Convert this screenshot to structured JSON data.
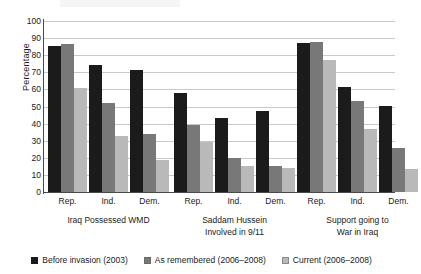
{
  "chart_data": {
    "type": "bar",
    "title": "",
    "xlabel": "",
    "ylabel": "Percentage",
    "ylim": [
      0,
      100
    ],
    "ytick_values": [
      0,
      10,
      20,
      30,
      40,
      50,
      60,
      70,
      80,
      90,
      100
    ],
    "ytick_labels": [
      "0",
      "10",
      "20",
      "30",
      "40",
      "50",
      "60",
      "70",
      "80",
      "90",
      "100"
    ],
    "grid": true,
    "legend_position": "bottom",
    "categories": [
      "Rep.",
      "Ind.",
      "Dem.",
      "Rep.",
      "Ind.",
      "Dem.",
      "Rep.",
      "Ind.",
      "Dem."
    ],
    "groups": [
      {
        "label_lines": [
          "Iraq Possessed WMD"
        ],
        "categories": [
          "Rep.",
          "Ind.",
          "Dem."
        ],
        "series": [
          {
            "name": "Before invasion (2003)",
            "values": [
              85.5,
              74,
              71.5
            ]
          },
          {
            "name": "As remembered (2006–2008)",
            "values": [
              86.5,
              52,
              34
            ]
          },
          {
            "name": "Current (2006–2008)",
            "values": [
              61,
              33,
              19
            ]
          }
        ]
      },
      {
        "label_lines": [
          "Saddam Hussein",
          "Involved in 9/11"
        ],
        "categories": [
          "Rep.",
          "Ind.",
          "Dem."
        ],
        "series": [
          {
            "name": "Before invasion (2003)",
            "values": [
              58,
              43,
              47.5
            ]
          },
          {
            "name": "As remembered (2006–2008)",
            "values": [
              39,
              20,
              15.5
            ]
          },
          {
            "name": "Current (2006–2008)",
            "values": [
              29,
              15,
              14
            ]
          }
        ]
      },
      {
        "label_lines": [
          "Support going to",
          "War in Iraq"
        ],
        "categories": [
          "Rep.",
          "Ind.",
          "Dem."
        ],
        "series": [
          {
            "name": "Before invasion (2003)",
            "values": [
              87,
              61.5,
              50.5
            ]
          },
          {
            "name": "As remembered (2006–2008)",
            "values": [
              88,
              53,
              26
            ]
          },
          {
            "name": "Current (2006–2008)",
            "values": [
              77,
              37,
              13.5
            ]
          }
        ]
      }
    ],
    "series": [
      {
        "name": "Before invasion (2003)",
        "color": "#1b1b1b",
        "values": [
          85.5,
          74,
          71.5,
          58,
          43,
          47.5,
          87,
          61.5,
          50.5
        ]
      },
      {
        "name": "As remembered (2006–2008)",
        "color": "#787878",
        "values": [
          86.5,
          52,
          34,
          39,
          20,
          15.5,
          88,
          53,
          26
        ]
      },
      {
        "name": "Current (2006–2008)",
        "color": "#b9b9b9",
        "values": [
          61,
          33,
          19,
          29,
          15,
          14,
          77,
          37,
          13.5
        ]
      }
    ]
  },
  "legend": {
    "items": [
      {
        "label": "Before invasion (2003)",
        "color": "#1b1b1b"
      },
      {
        "label": "As remembered (2006–2008)",
        "color": "#787878"
      },
      {
        "label": "Current (2006–2008)",
        "color": "#b9b9b9"
      }
    ]
  }
}
